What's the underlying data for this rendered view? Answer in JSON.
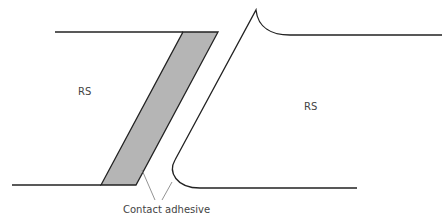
{
  "diagram": {
    "labels": {
      "left_region": "RS",
      "right_region": "RS",
      "adhesive": "Contact adhesive"
    },
    "colors": {
      "stroke": "#222222",
      "adhesive_fill": "#b5b5b5",
      "leader": "#777777",
      "text": "#444444"
    }
  }
}
